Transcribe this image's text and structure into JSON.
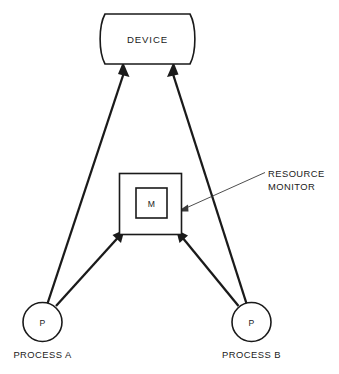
{
  "diagram": {
    "background_color": "#ffffff",
    "line_color": "#1a1a1a",
    "leader_color": "#3a3a3a",
    "nodes": {
      "device": {
        "label": "DEVICE",
        "shape": "curved-sided-rectangle"
      },
      "monitor_outer": {
        "shape": "square"
      },
      "monitor_inner": {
        "label": "M",
        "shape": "square"
      },
      "process_a": {
        "symbol": "P",
        "label": "PROCESS A",
        "shape": "circle"
      },
      "process_b": {
        "symbol": "P",
        "label": "PROCESS B",
        "shape": "circle"
      }
    },
    "annotations": {
      "resource_monitor": {
        "line1": "RESOURCE",
        "line2": "MONITOR"
      }
    },
    "connectors": [
      {
        "from": "process_a",
        "to": "device",
        "style": "thick-arrow"
      },
      {
        "from": "process_b",
        "to": "device",
        "style": "thick-arrow"
      },
      {
        "from": "process_a",
        "to": "monitor",
        "style": "thick-arrow"
      },
      {
        "from": "process_b",
        "to": "monitor",
        "style": "thick-arrow"
      },
      {
        "from": "resource_monitor_label",
        "to": "monitor",
        "style": "thin-leader-arrow"
      }
    ]
  }
}
